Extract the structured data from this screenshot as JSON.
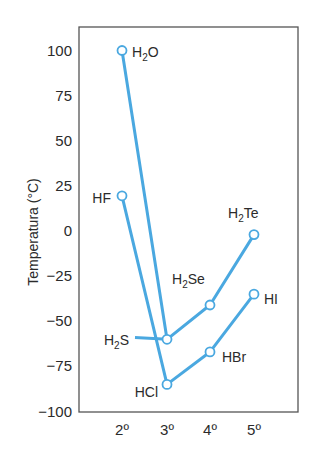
{
  "chart_data": {
    "type": "line",
    "title": "",
    "xlabel": "",
    "ylabel": "Temperatura (°C)",
    "ylim": [
      -100,
      100
    ],
    "yticks": [
      100,
      75,
      50,
      25,
      0,
      -25,
      -50,
      -75,
      -100
    ],
    "yticklabels": [
      "100",
      "75",
      "50",
      "25",
      "0",
      "−25",
      "−50",
      "−75",
      "−100"
    ],
    "categories": [
      "2º",
      "3º",
      "4º",
      "5º"
    ],
    "grid": false,
    "legend": "none (inline point labels)",
    "series": [
      {
        "name": "Grupo 16 (H2X)",
        "points": [
          {
            "x": "2º",
            "y": 100,
            "label": "H2O"
          },
          {
            "x": "3º",
            "y": -60,
            "label": "H2S"
          },
          {
            "x": "4º",
            "y": -41,
            "label": "H2Se"
          },
          {
            "x": "5º",
            "y": -2,
            "label": "H2Te"
          }
        ]
      },
      {
        "name": "Grupo 17 (HX)",
        "points": [
          {
            "x": "2º",
            "y": 19.5,
            "label": "HF"
          },
          {
            "x": "3º",
            "y": -85,
            "label": "HCl"
          },
          {
            "x": "4º",
            "y": -67,
            "label": "HBr"
          },
          {
            "x": "5º",
            "y": -35,
            "label": "HI"
          }
        ]
      }
    ],
    "colors": {
      "line": "#4aa8e0",
      "marker_fill": "#ffffff",
      "axis": "#555555"
    }
  }
}
